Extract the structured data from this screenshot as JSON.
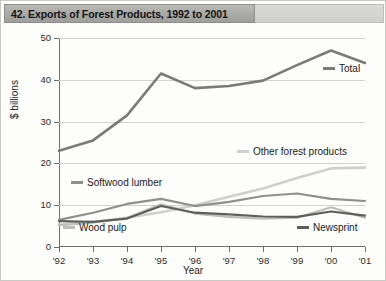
{
  "title": "42. Exports of Forest Products, 1992 to 2001",
  "axes": {
    "ylabel": "$ billions",
    "xlabel": "Year",
    "yticks": [
      "0",
      "10",
      "20",
      "30",
      "40",
      "50"
    ],
    "xticks": [
      "'92",
      "'93",
      "'94",
      "'95",
      "'96",
      "'97",
      "'98",
      "'99",
      "'00",
      "'01"
    ]
  },
  "labels": {
    "total": "Total",
    "other": "Other forest products",
    "softwood": "Softwood lumber",
    "woodpulp": "Wood pulp",
    "newsprint": "Newsprint"
  },
  "colors": {
    "total": "#7a7a77",
    "other": "#cfcfcb",
    "softwood": "#8f8f8c",
    "woodpulp": "#bdbdba",
    "newsprint": "#5e5e5b",
    "title_bar": "#a9a9a6",
    "grid": "#d2d2cf",
    "axis": "#6e6e6b"
  },
  "chart_data": {
    "type": "line",
    "title": "42. Exports of Forest Products, 1992 to 2001",
    "xlabel": "Year",
    "ylabel": "$ billions",
    "ylim": [
      0,
      50
    ],
    "grid": true,
    "legend": "inline-annotations",
    "categories": [
      "'92",
      "'93",
      "'94",
      "'95",
      "'96",
      "'97",
      "'98",
      "'99",
      "'00",
      "'01"
    ],
    "series": [
      {
        "name": "Total",
        "values": [
          23.0,
          25.5,
          31.5,
          41.5,
          38.0,
          38.5,
          39.8,
          43.5,
          47.0,
          44.0
        ]
      },
      {
        "name": "Other forest products",
        "values": [
          5.3,
          6.0,
          7.0,
          8.3,
          10.0,
          12.0,
          14.0,
          16.5,
          18.8,
          19.0
        ]
      },
      {
        "name": "Softwood lumber",
        "values": [
          6.5,
          8.2,
          10.3,
          11.5,
          9.8,
          10.8,
          12.2,
          12.8,
          11.5,
          11.0
        ]
      },
      {
        "name": "Wood pulp",
        "values": [
          5.2,
          5.8,
          7.0,
          10.2,
          8.0,
          7.2,
          6.8,
          7.0,
          9.5,
          7.0
        ]
      },
      {
        "name": "Newsprint",
        "values": [
          6.2,
          6.0,
          6.8,
          9.8,
          8.2,
          7.8,
          7.3,
          7.2,
          8.5,
          7.5
        ]
      }
    ]
  }
}
